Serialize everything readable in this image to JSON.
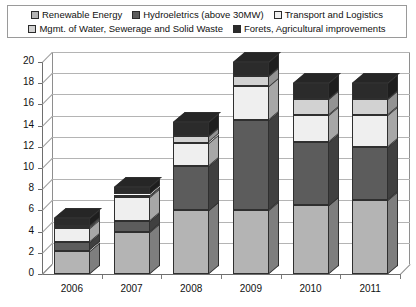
{
  "legend": {
    "rows": [
      [
        {
          "label": "Renewable Energy",
          "color": "#b4b4b4",
          "name": "renewable-energy"
        },
        {
          "label": "Hydroeletrics (above 30MW)",
          "color": "#5c5c5c",
          "name": "hydroelectrics"
        },
        {
          "label": "Transport and Logistics",
          "color": "#efefef",
          "name": "transport-logistics"
        }
      ],
      [
        {
          "label": "Mgmt. of Water, Sewerage and Solid Waste",
          "color": "#d2d2d2",
          "name": "water-sewerage-waste"
        },
        {
          "label": "Forets, Agricultural improvements",
          "color": "#2b2b2b",
          "name": "forests-agriculture"
        }
      ]
    ]
  },
  "chart_data": {
    "type": "bar",
    "stacked": true,
    "title": "",
    "xlabel": "",
    "ylabel": "",
    "categories": [
      "2006",
      "2007",
      "2008",
      "2009",
      "2010",
      "2011"
    ],
    "yticks": [
      0,
      2,
      4,
      6,
      8,
      10,
      12,
      14,
      16,
      18,
      20
    ],
    "ylim": [
      0,
      20
    ],
    "grid": true,
    "legend_position": "top",
    "series": [
      {
        "name": "Renewable Energy",
        "color": "#b4b4b4",
        "values": [
          2.2,
          4.0,
          6.0,
          6.0,
          6.5,
          7.0
        ]
      },
      {
        "name": "Hydroeletrics (above 30MW)",
        "color": "#5c5c5c",
        "values": [
          0.8,
          1.0,
          4.2,
          8.5,
          6.0,
          5.0
        ]
      },
      {
        "name": "Transport and Logistics",
        "color": "#efefef",
        "values": [
          1.3,
          2.3,
          2.2,
          3.2,
          2.5,
          3.0
        ]
      },
      {
        "name": "Mgmt. of Water, Sewerage and Solid Waste",
        "color": "#d2d2d2",
        "values": [
          0.2,
          0.2,
          0.6,
          1.0,
          1.5,
          1.5
        ]
      },
      {
        "name": "Forets, Agricultural improvements",
        "color": "#2b2b2b",
        "values": [
          0.8,
          0.7,
          1.3,
          1.3,
          1.5,
          1.5
        ]
      }
    ],
    "totals": [
      5.3,
      8.2,
      14.3,
      20.0,
      18.0,
      18.0
    ]
  },
  "axis": {
    "y_min_label": "0",
    "y_max_label": "20"
  }
}
